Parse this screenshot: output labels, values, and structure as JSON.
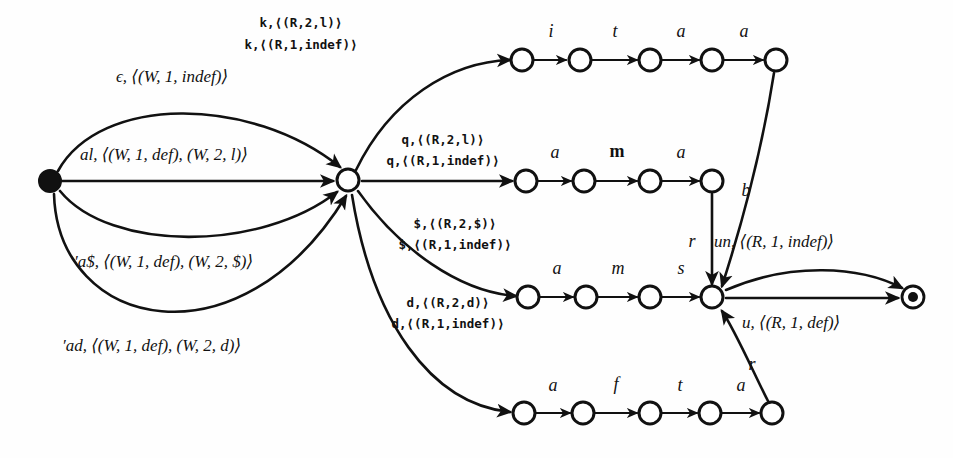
{
  "diagram": {
    "colors": {
      "ink": "#111111",
      "paper": "#fefefe"
    },
    "nodes": [
      {
        "id": "start",
        "name": "start-state",
        "kind": "start",
        "x": 50,
        "y": 181
      },
      {
        "id": "hub",
        "name": "hub-state",
        "kind": "open",
        "x": 348,
        "y": 180
      },
      {
        "id": "r1n1",
        "name": "row1-state-1",
        "kind": "open",
        "x": 522,
        "y": 60
      },
      {
        "id": "r1n2",
        "name": "row1-state-2",
        "kind": "open",
        "x": 580,
        "y": 60
      },
      {
        "id": "r1n3",
        "name": "row1-state-3",
        "kind": "open",
        "x": 650,
        "y": 60
      },
      {
        "id": "r1n4",
        "name": "row1-state-4",
        "kind": "open",
        "x": 712,
        "y": 60
      },
      {
        "id": "r1n5",
        "name": "row1-state-5",
        "kind": "open",
        "x": 776,
        "y": 60
      },
      {
        "id": "r2n1",
        "name": "row2-state-1",
        "kind": "open",
        "x": 526,
        "y": 181
      },
      {
        "id": "r2n2",
        "name": "row2-state-2",
        "kind": "open",
        "x": 584,
        "y": 181
      },
      {
        "id": "r2n3",
        "name": "row2-state-3",
        "kind": "open",
        "x": 650,
        "y": 181
      },
      {
        "id": "r2n4",
        "name": "row2-state-4",
        "kind": "open",
        "x": 712,
        "y": 181
      },
      {
        "id": "r3n1",
        "name": "row3-state-1",
        "kind": "open",
        "x": 528,
        "y": 297
      },
      {
        "id": "r3n2",
        "name": "row3-state-2",
        "kind": "open",
        "x": 586,
        "y": 297
      },
      {
        "id": "r3n3",
        "name": "row3-state-3",
        "kind": "open",
        "x": 650,
        "y": 297
      },
      {
        "id": "r3n4",
        "name": "row3-state-4",
        "kind": "open",
        "x": 712,
        "y": 297
      },
      {
        "id": "r4n1",
        "name": "row4-state-1",
        "kind": "open",
        "x": 524,
        "y": 413
      },
      {
        "id": "r4n2",
        "name": "row4-state-2",
        "kind": "open",
        "x": 583,
        "y": 413
      },
      {
        "id": "r4n3",
        "name": "row4-state-3",
        "kind": "open",
        "x": 650,
        "y": 413
      },
      {
        "id": "r4n4",
        "name": "row4-state-4",
        "kind": "open",
        "x": 710,
        "y": 413
      },
      {
        "id": "r4n5",
        "name": "row4-state-5",
        "kind": "open",
        "x": 772,
        "y": 413
      },
      {
        "id": "accept",
        "name": "accept-state",
        "kind": "accept",
        "x": 913,
        "y": 297
      }
    ],
    "labels": {
      "epsilon_edge": "ϵ, ⟨(W, 1, indef)⟩",
      "al_edge": "al, ⟨(W, 1, def), (W, 2, l)⟩",
      "adollar_edge": "′a$, ⟨(W, 1, def), (W, 2, $)⟩",
      "ad_edge": "′ad, ⟨(W, 1, def), (W, 2, d)⟩",
      "k_line1": "k,⟨(R,2,l)⟩",
      "k_line2": "k,⟨(R,1,indef)⟩",
      "q_line1": "q,⟨(R,2,l)⟩",
      "q_line2": "q,⟨(R,1,indef)⟩",
      "dollar_line1": "$,⟨(R,2,$)⟩",
      "dollar_line2": "$,⟨(R,1,indef)⟩",
      "d_line1": "d,⟨(R,2,d)⟩",
      "d_line2": "d,⟨(R,1,indef)⟩",
      "row1_i": "i",
      "row1_t": "t",
      "row1_a1": "a",
      "row1_a2": "a",
      "row2_a1": "a",
      "row2_m": "m",
      "row2_a2": "a",
      "row3_a": "a",
      "row3_m": "m",
      "row3_s": "s",
      "row4_a1": "a",
      "row4_f": "f",
      "row4_t": "t",
      "row4_a2": "a",
      "b_label": "b",
      "r_upper": "r",
      "un_edge": "un, ⟨(R, 1, indef)⟩",
      "u_edge": "u, ⟨(R, 1, def)⟩",
      "r_lower": "r"
    }
  }
}
